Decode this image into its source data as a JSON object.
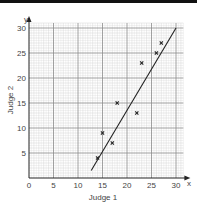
{
  "chart_data": {
    "type": "scatter",
    "title": "",
    "xlabel": "Judge 1",
    "ylabel": "Judge 2",
    "x_axis_letter": "x",
    "y_axis_letter": "y",
    "xlim": [
      0,
      31.5
    ],
    "ylim": [
      0,
      31
    ],
    "xticks": [
      0,
      5,
      10,
      15,
      20,
      25,
      30
    ],
    "yticks": [
      5,
      10,
      15,
      20,
      25,
      30
    ],
    "origin_label": "0",
    "grid": true,
    "minor_grid_step": 1,
    "major_grid_step": 5,
    "marker": "x",
    "points": [
      {
        "x": 14,
        "y": 4
      },
      {
        "x": 15,
        "y": 9
      },
      {
        "x": 17,
        "y": 7
      },
      {
        "x": 18,
        "y": 15
      },
      {
        "x": 22,
        "y": 13
      },
      {
        "x": 23,
        "y": 23
      },
      {
        "x": 26,
        "y": 25
      },
      {
        "x": 27,
        "y": 27
      }
    ],
    "line_of_best_fit": {
      "x1": 12.7,
      "y1": 1.5,
      "x2": 30,
      "y2": 30
    }
  },
  "colors": {
    "minor_grid": "#d6d6d6",
    "major_grid": "#8a8a8a",
    "axis": "#222222",
    "line": "#222222",
    "marker": "#222222"
  }
}
